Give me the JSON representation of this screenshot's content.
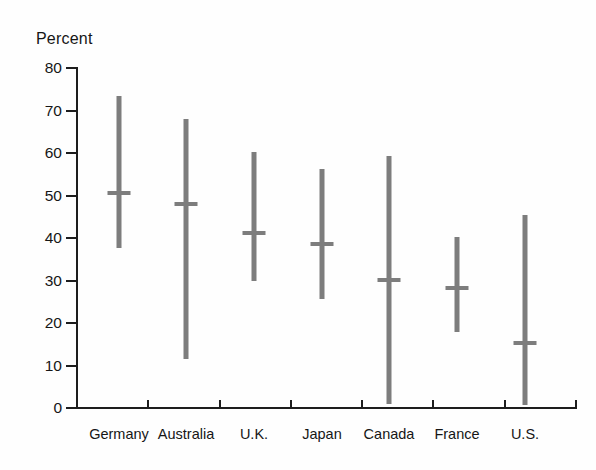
{
  "chart_data": {
    "type": "bar",
    "subtype": "range-whisker",
    "title": "",
    "xlabel": "",
    "ylabel": "Percent",
    "ylim": [
      0,
      80
    ],
    "yticks": [
      0,
      10,
      20,
      30,
      40,
      50,
      60,
      70,
      80
    ],
    "ytick_labels": [
      "0",
      "10",
      "20",
      "30",
      "40",
      "50",
      "60",
      "70",
      "80"
    ],
    "grid": false,
    "legend": "none",
    "series_description": "Vertical range bar with median marker for each country",
    "categories": [
      "Germany",
      "Australia",
      "U.K.",
      "Japan",
      "Canada",
      "France",
      "U.S."
    ],
    "series": [
      {
        "name": "High",
        "values": [
          73.4,
          68.0,
          60.2,
          56.2,
          59.3,
          40.2,
          45.4
        ]
      },
      {
        "name": "Median",
        "values": [
          50.6,
          48.0,
          41.2,
          38.6,
          30.1,
          28.2,
          15.3
        ]
      },
      {
        "name": "Low",
        "values": [
          37.6,
          11.5,
          29.9,
          25.6,
          1.0,
          17.9,
          0.7
        ]
      }
    ],
    "points": [
      {
        "category": "Germany",
        "high": 73.4,
        "median": 50.6,
        "low": 37.6
      },
      {
        "category": "Australia",
        "high": 68.0,
        "median": 48.0,
        "low": 11.5
      },
      {
        "category": "U.K.",
        "high": 60.2,
        "median": 41.2,
        "low": 29.9
      },
      {
        "category": "Japan",
        "high": 56.2,
        "median": 38.6,
        "low": 25.6
      },
      {
        "category": "Canada",
        "high": 59.3,
        "median": 30.1,
        "low": 1.0
      },
      {
        "category": "France",
        "high": 40.2,
        "median": 28.2,
        "low": 17.9
      },
      {
        "category": "U.S.",
        "high": 45.4,
        "median": 15.3,
        "low": 0.7
      }
    ],
    "colors": {
      "bar": "#7d7d7d",
      "axis": "#1d1d1d",
      "text": "#161616",
      "background": "#fefefe"
    }
  },
  "layout": {
    "baseline_y": 408,
    "top_y": 68,
    "px_per_unit": 4.25,
    "axis_x": 77,
    "plot_right": 576,
    "bar_centers": [
      119,
      186,
      254,
      322,
      389,
      457,
      525
    ]
  }
}
